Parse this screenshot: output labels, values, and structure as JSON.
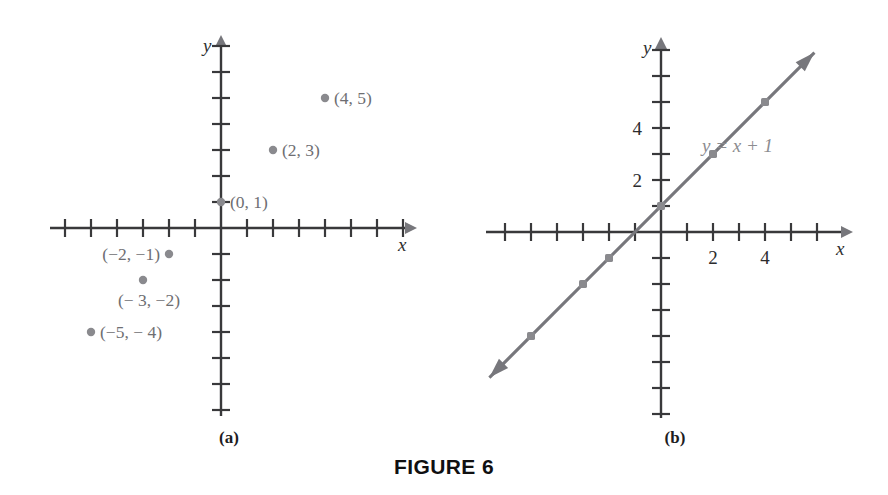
{
  "figure": {
    "caption": "FIGURE 6",
    "panels": [
      {
        "id": "a",
        "caption": "(a)"
      },
      {
        "id": "b",
        "caption": "(b)"
      }
    ]
  },
  "chart_data": [
    {
      "type": "scatter",
      "panel": "a",
      "title": "",
      "xlabel": "x",
      "ylabel": "y",
      "xlim": [
        -7,
        7
      ],
      "ylim": [
        -7,
        7
      ],
      "grid": false,
      "axis_numbers_shown": false,
      "tick_interval": 1,
      "points": [
        {
          "x": 0,
          "y": 1,
          "label": "(0, 1)",
          "label_side": "right"
        },
        {
          "x": 2,
          "y": 3,
          "label": "(2, 3)",
          "label_side": "right"
        },
        {
          "x": 4,
          "y": 5,
          "label": "(4, 5)",
          "label_side": "right"
        },
        {
          "x": -2,
          "y": -1,
          "label": "(−2, −1)",
          "label_side": "left"
        },
        {
          "x": -3,
          "y": -2,
          "label": "(− 3, −2)",
          "label_side": "below"
        },
        {
          "x": -5,
          "y": -4,
          "label": "(−5, − 4)",
          "label_side": "right"
        }
      ]
    },
    {
      "type": "line",
      "panel": "b",
      "title": "",
      "xlabel": "x",
      "ylabel": "y",
      "equation": "y = x + 1",
      "xlim": [
        -7,
        7
      ],
      "ylim": [
        -7,
        7
      ],
      "grid": false,
      "tick_interval": 1,
      "x_tick_labels": [
        {
          "x": 2,
          "text": "2"
        },
        {
          "x": 4,
          "text": "4"
        }
      ],
      "y_tick_labels": [
        {
          "y": 2,
          "text": "2"
        },
        {
          "y": 4,
          "text": "4"
        }
      ],
      "slope": 1,
      "intercept": 1,
      "line_endpoints": {
        "x_start": -6.6,
        "x_end": 5.9
      },
      "arrowheads": [
        "start",
        "end"
      ],
      "marked_points": [
        {
          "x": -5,
          "y": -4
        },
        {
          "x": -3,
          "y": -2
        },
        {
          "x": -2,
          "y": -1
        },
        {
          "x": 0,
          "y": 1
        },
        {
          "x": 2,
          "y": 3
        },
        {
          "x": 4,
          "y": 5
        }
      ]
    }
  ],
  "colors": {
    "axis": "#39393b",
    "point": "#8a8a8e",
    "point_label": "#6e6e72",
    "line": "#77777c",
    "equation_label": "#8c8c90",
    "caption": "#101011",
    "background": "#ffffff"
  },
  "labels": {
    "axis_x": "x",
    "axis_y": "y"
  }
}
